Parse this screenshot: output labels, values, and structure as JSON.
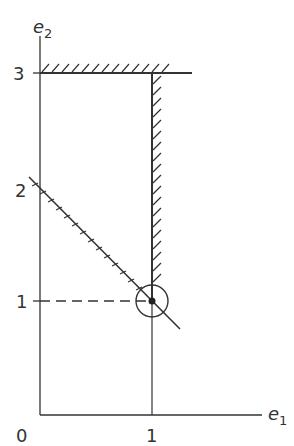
{
  "diagram": {
    "axes": {
      "x_label": "e",
      "x_sub": "1",
      "y_label": "e",
      "y_sub": "2"
    },
    "ticks": {
      "x": [
        "0",
        "1"
      ],
      "y": [
        "1",
        "2",
        "3"
      ]
    },
    "constraints": [
      {
        "name": "e2 <= 3",
        "type": "horizontal",
        "value": 3,
        "hatched": "above"
      },
      {
        "name": "e1 <= 1",
        "type": "vertical",
        "value": 1,
        "hatched": "right",
        "from_e2": 1,
        "to_e2": 3
      },
      {
        "name": "e1 + e2 >= 2",
        "type": "diagonal",
        "hatched": "below-left"
      }
    ],
    "optimal_point": {
      "e1": 1,
      "e2": 1,
      "marker": "circled-dot"
    },
    "colors": {
      "line": "#333333",
      "background": "#ffffff"
    }
  }
}
